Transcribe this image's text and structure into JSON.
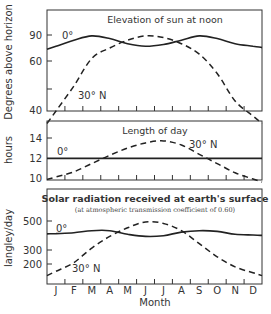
{
  "chart_data": [
    {
      "type": "line",
      "title": "Elevation of sun at noon",
      "xlabel": "",
      "ylabel": "Degrees above horizon",
      "yticks": [
        40,
        60,
        90
      ],
      "ylim": [
        40,
        100
      ],
      "categories": [
        "J",
        "F",
        "M",
        "A",
        "M",
        "J",
        "J",
        "A",
        "S",
        "O",
        "N",
        "D"
      ],
      "series": [
        {
          "name": "0°",
          "style": "solid",
          "values": [
            77,
            84,
            89,
            86,
            80,
            77,
            79,
            84,
            89,
            86,
            80,
            77
          ]
        },
        {
          "name": "30° N",
          "style": "dashed",
          "values": [
            40,
            50,
            63,
            75,
            84,
            89,
            87,
            80,
            68,
            55,
            44,
            38
          ]
        }
      ],
      "grid": false
    },
    {
      "type": "line",
      "title": "Length of day",
      "xlabel": "",
      "ylabel": "hours",
      "yticks": [
        10,
        12,
        14
      ],
      "ylim": [
        10,
        16
      ],
      "categories": [
        "J",
        "F",
        "M",
        "A",
        "M",
        "J",
        "J",
        "A",
        "S",
        "O",
        "N",
        "D"
      ],
      "series": [
        {
          "name": "0°",
          "style": "solid",
          "values": [
            12,
            12,
            12,
            12,
            12,
            12,
            12,
            12,
            12,
            12,
            12,
            12
          ]
        },
        {
          "name": "30° N",
          "style": "dashed",
          "values": [
            10.2,
            10.7,
            11.5,
            12.3,
            13.0,
            13.5,
            13.7,
            13.3,
            12.4,
            11.5,
            10.6,
            10.0
          ]
        }
      ],
      "grid": false
    },
    {
      "type": "line",
      "title": "Solar radiation received at earth's surface",
      "subtitle": "(at atmospheric transmission coefficient of 0.60)",
      "xlabel": "Month",
      "ylabel": "langley/day",
      "yticks": [
        200,
        300,
        500
      ],
      "ylim": [
        120,
        620
      ],
      "categories": [
        "J",
        "F",
        "M",
        "A",
        "M",
        "J",
        "J",
        "A",
        "S",
        "O",
        "N",
        "D"
      ],
      "series": [
        {
          "name": "0°",
          "style": "solid",
          "values": [
            410,
            415,
            430,
            430,
            405,
            390,
            395,
            420,
            430,
            425,
            405,
            400
          ]
        },
        {
          "name": "30° N",
          "style": "dashed",
          "values": [
            150,
            210,
            310,
            390,
            450,
            490,
            480,
            430,
            340,
            250,
            180,
            140
          ]
        }
      ],
      "grid": false
    }
  ],
  "labels": {
    "panel1_title": "Elevation of sun at noon",
    "panel1_ylabel": "Degrees above horizon",
    "panel1_series_0": "0°",
    "panel1_series_30": "30° N",
    "panel1_ticks": [
      "90",
      "60",
      "40"
    ],
    "panel2_title": "Length of day",
    "panel2_ylabel": "hours",
    "panel2_series_0": "0°",
    "panel2_series_30": "30° N",
    "panel2_ticks": [
      "14",
      "12",
      "10"
    ],
    "panel3_title": "Solar radiation received at earth's surface",
    "panel3_subtitle": "(at atmospheric transmission coefficient of 0.60)",
    "panel3_ylabel": "langley/day",
    "panel3_series_0": "0°",
    "panel3_series_30": "30° N",
    "panel3_ticks": [
      "500",
      "300",
      "200"
    ],
    "months": [
      "J",
      "F",
      "M",
      "A",
      "M",
      "J",
      "J",
      "A",
      "S",
      "O",
      "N",
      "D"
    ],
    "xlabel": "Month"
  }
}
